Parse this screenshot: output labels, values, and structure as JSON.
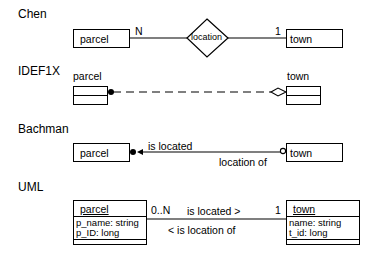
{
  "chen": {
    "heading": "Chen",
    "entity_left": "parcel",
    "entity_right": "town",
    "relationship": "location",
    "card_left": "N",
    "card_right": "1"
  },
  "idef1x": {
    "heading": "IDEF1X",
    "entity_left": "parcel",
    "entity_right": "town"
  },
  "bachman": {
    "heading": "Bachman",
    "entity_left": "parcel",
    "entity_right": "town",
    "role_forward": "is located",
    "role_reverse": "location of"
  },
  "uml": {
    "heading": "UML",
    "class_left": {
      "name": "parcel",
      "attributes": [
        "p_name: string",
        "p_ID: long"
      ]
    },
    "class_right": {
      "name": "town",
      "attributes": [
        "name: string",
        "t_id: long"
      ]
    },
    "mult_left": "0..N",
    "mult_right": "1",
    "role_forward": "is located >",
    "role_reverse": "< is location of"
  }
}
